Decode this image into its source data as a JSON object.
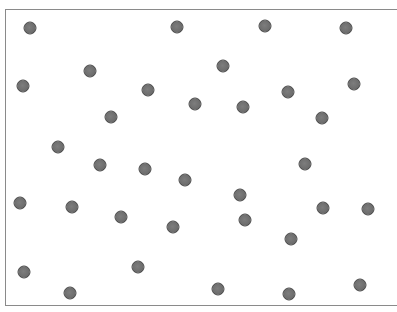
{
  "figure": {
    "type": "scatter-dots",
    "frame": {
      "left": 5,
      "top": 9,
      "right": 395,
      "bottom": 306
    },
    "dot_color": "#6e6e6e",
    "dot_border": "#444444",
    "dot_radius": 6.5,
    "background": "#ffffff"
  },
  "dots": [
    {
      "x": 30,
      "y": 28
    },
    {
      "x": 177,
      "y": 27
    },
    {
      "x": 265,
      "y": 26
    },
    {
      "x": 346,
      "y": 28
    },
    {
      "x": 90,
      "y": 71
    },
    {
      "x": 223,
      "y": 66
    },
    {
      "x": 23,
      "y": 86
    },
    {
      "x": 148,
      "y": 90
    },
    {
      "x": 354,
      "y": 84
    },
    {
      "x": 195,
      "y": 104
    },
    {
      "x": 243,
      "y": 107
    },
    {
      "x": 288,
      "y": 92
    },
    {
      "x": 111,
      "y": 117
    },
    {
      "x": 322,
      "y": 118
    },
    {
      "x": 58,
      "y": 147
    },
    {
      "x": 305,
      "y": 164
    },
    {
      "x": 100,
      "y": 165
    },
    {
      "x": 145,
      "y": 169
    },
    {
      "x": 185,
      "y": 180
    },
    {
      "x": 20,
      "y": 203
    },
    {
      "x": 72,
      "y": 207
    },
    {
      "x": 121,
      "y": 217
    },
    {
      "x": 173,
      "y": 227
    },
    {
      "x": 240,
      "y": 195
    },
    {
      "x": 245,
      "y": 220
    },
    {
      "x": 323,
      "y": 208
    },
    {
      "x": 368,
      "y": 209
    },
    {
      "x": 291,
      "y": 239
    },
    {
      "x": 138,
      "y": 267
    },
    {
      "x": 24,
      "y": 272
    },
    {
      "x": 70,
      "y": 293
    },
    {
      "x": 218,
      "y": 289
    },
    {
      "x": 289,
      "y": 294
    },
    {
      "x": 360,
      "y": 285
    }
  ]
}
